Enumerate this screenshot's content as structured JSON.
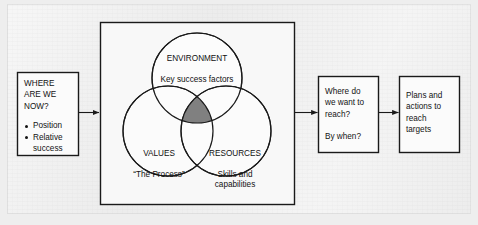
{
  "diagram": {
    "colors": {
      "page_background": "#ececec",
      "stroke": "#1a1a1a",
      "frame_fill": "#f7f7f7",
      "circle_fill": "#fbfbfb",
      "intersection_fill": "#808080",
      "text": "#131313"
    },
    "boxes": [
      {
        "id": "where-are-we-now",
        "heading": "WHERE\nARE WE\nNOW?",
        "bullets": [
          "Position",
          "Relative"
        ],
        "bullet_continuation": "success"
      },
      {
        "id": "where-do-we-want-to-reach",
        "line1": "Where do\nwe want to\nreach?",
        "line2": "By when?"
      },
      {
        "id": "plans-and-actions",
        "text": "Plans and\nactions to\nreach\ntargets"
      }
    ],
    "venn": {
      "environment": {
        "title": "ENVIRONMENT",
        "subtitle": "Key success factors"
      },
      "values": {
        "title": "VALUES",
        "subtitle": "“The Process”"
      },
      "resources": {
        "title": "RESOURCES",
        "subtitle": "Skills and\ncapabilities"
      }
    },
    "arrows": [
      {
        "id": "arrow-left-to-frame"
      },
      {
        "id": "arrow-frame-to-box3"
      },
      {
        "id": "arrow-box3-to-box4"
      }
    ]
  }
}
